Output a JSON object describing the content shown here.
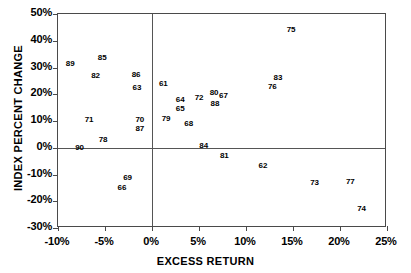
{
  "chart_data": {
    "type": "scatter",
    "title": "",
    "xlabel": "EXCESS RETURN",
    "ylabel": "INDEX PERCENT CHANGE",
    "xlim": [
      -10,
      25
    ],
    "ylim": [
      -30,
      50
    ],
    "xticks": [
      "-10%",
      "-5%",
      "0%",
      "5%",
      "10%",
      "15%",
      "20%",
      "25%"
    ],
    "xtick_values": [
      -10,
      -5,
      0,
      5,
      10,
      15,
      20,
      25
    ],
    "yticks": [
      "50%",
      "40%",
      "30%",
      "20%",
      "10%",
      "0%",
      "-10%",
      "-20%",
      "-30%"
    ],
    "ytick_values": [
      50,
      40,
      30,
      20,
      10,
      0,
      -10,
      -20,
      -30
    ],
    "grid": false,
    "legend": null,
    "marker_style": "text-label",
    "zero_lines": [
      {
        "axis": "x",
        "value": 0
      },
      {
        "axis": "y",
        "value": 0
      }
    ],
    "point_label_key": "year",
    "points": [
      {
        "year": "89",
        "x": -8.7,
        "y": 31.4
      },
      {
        "year": "85",
        "x": -5.3,
        "y": 33.6
      },
      {
        "year": "82",
        "x": -6.0,
        "y": 26.9
      },
      {
        "year": "86",
        "x": -1.7,
        "y": 27.3
      },
      {
        "year": "63",
        "x": -1.6,
        "y": 22.4
      },
      {
        "year": "71",
        "x": -6.7,
        "y": 10.5
      },
      {
        "year": "70",
        "x": -1.3,
        "y": 10.5
      },
      {
        "year": "87",
        "x": -1.3,
        "y": 7.1
      },
      {
        "year": "78",
        "x": -5.2,
        "y": 3.0
      },
      {
        "year": "90",
        "x": -7.7,
        "y": 0.0
      },
      {
        "year": "69",
        "x": -2.6,
        "y": -11.2
      },
      {
        "year": "66",
        "x": -3.2,
        "y": -15.0
      },
      {
        "year": "61",
        "x": 1.2,
        "y": 23.9
      },
      {
        "year": "64",
        "x": 3.0,
        "y": 17.9
      },
      {
        "year": "72",
        "x": 5.0,
        "y": 18.7
      },
      {
        "year": "80",
        "x": 6.6,
        "y": 20.6
      },
      {
        "year": "67",
        "x": 7.6,
        "y": 19.4
      },
      {
        "year": "65",
        "x": 3.0,
        "y": 14.6
      },
      {
        "year": "88",
        "x": 6.7,
        "y": 16.4
      },
      {
        "year": "79",
        "x": 1.5,
        "y": 10.8
      },
      {
        "year": "68",
        "x": 3.9,
        "y": 9.0
      },
      {
        "year": "75",
        "x": 14.8,
        "y": 44.1
      },
      {
        "year": "83",
        "x": 13.4,
        "y": 26.2
      },
      {
        "year": "76",
        "x": 12.8,
        "y": 22.8
      },
      {
        "year": "84",
        "x": 5.5,
        "y": 0.7
      },
      {
        "year": "81",
        "x": 7.7,
        "y": -3.0
      },
      {
        "year": "62",
        "x": 11.8,
        "y": -6.7
      },
      {
        "year": "73",
        "x": 17.3,
        "y": -13.1
      },
      {
        "year": "77",
        "x": 21.1,
        "y": -12.7
      },
      {
        "year": "74",
        "x": 22.3,
        "y": -22.8
      }
    ]
  },
  "colors": {
    "axis": "#4a4a4a",
    "zero_line": "#555555",
    "text": "#000000",
    "background": "#ffffff"
  }
}
